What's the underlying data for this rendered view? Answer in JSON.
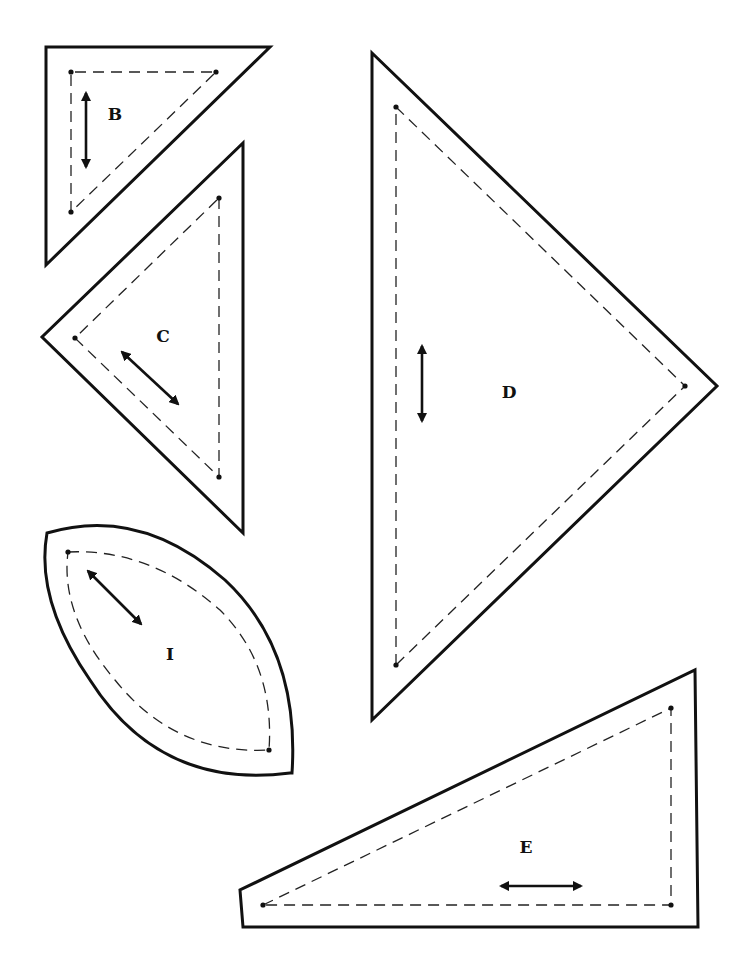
{
  "page": {
    "background": "#ffffff",
    "line_color": "#111111"
  },
  "legend": {
    "solid_line": "cutting line",
    "dashed_line": "sewing line",
    "double_arrow": "grain line"
  },
  "pieces": [
    {
      "id": "B",
      "label": "B",
      "shape": "right triangle",
      "grain": "vertical"
    },
    {
      "id": "C",
      "label": "C",
      "shape": "right isosceles triangle",
      "grain": "diagonal"
    },
    {
      "id": "I",
      "label": "I",
      "shape": "leaf / melon",
      "grain": "diagonal"
    },
    {
      "id": "D",
      "label": "D",
      "shape": "isosceles triangle",
      "grain": "vertical"
    },
    {
      "id": "E",
      "label": "E",
      "shape": "right triangle (long)",
      "grain": "horizontal"
    }
  ]
}
